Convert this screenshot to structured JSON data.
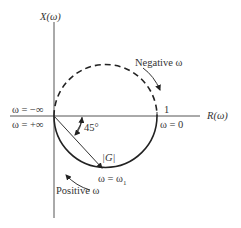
{
  "diagram": {
    "type": "polar-plot",
    "axes": {
      "vertical_label": "X(ω)",
      "horizontal_label": "R(ω)"
    },
    "labels": {
      "omega_neg_inf": "ω = −∞",
      "omega_pos_inf": "ω = +∞",
      "omega_zero": "ω = 0",
      "one_tick": "1",
      "angle": "45°",
      "magnitude": "|G|",
      "omega_one": "ω = ω",
      "omega_one_sub": "1",
      "negative_omega": "Negative ω",
      "positive_omega": "Positive ω"
    },
    "colors": {
      "ink": "#333333",
      "axis": "#555555",
      "background": "#ffffff"
    }
  }
}
